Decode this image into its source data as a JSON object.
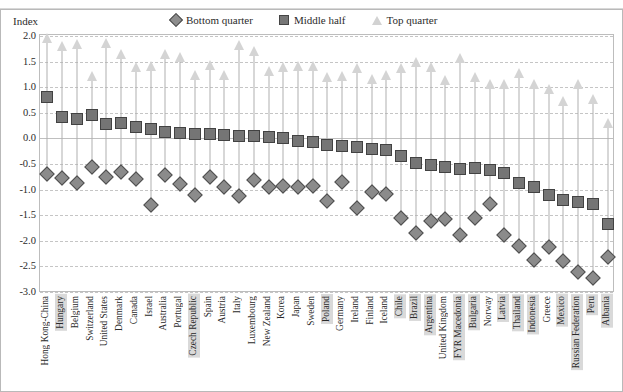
{
  "top_cut_text": " ",
  "axis": {
    "index_label": "Index",
    "y_ticks": [
      "2.0",
      "1.5",
      "1.0",
      "0.5",
      "0.0",
      "-0.5",
      "-1.0",
      "-1.5",
      "-2.0",
      "-2.5",
      "-3.0"
    ]
  },
  "legend": {
    "items": [
      {
        "label": "Bottom quarter",
        "icon": "diamond-marker",
        "color": "#8d8d8d"
      },
      {
        "label": "Middle half",
        "icon": "square-marker",
        "color": "#777777"
      },
      {
        "label": "Top quarter",
        "icon": "triangle-marker",
        "color": "#d2d2d2"
      }
    ]
  },
  "chart_data": {
    "type": "scatter",
    "title": "",
    "xlabel": "",
    "ylabel": "Index",
    "ylim": [
      -3.0,
      2.0
    ],
    "ytick_step": 0.5,
    "grid": true,
    "legend_position": "top",
    "categories": [
      "Hong Kong-China",
      "Hungary",
      "Belgium",
      "Switzerland",
      "United States",
      "Denmark",
      "Canada",
      "Israel",
      "Australia",
      "Portugal",
      "Czech Republic",
      "Spain",
      "Austria",
      "Italy",
      "Luxembourg",
      "New Zealand",
      "Korea",
      "Japan",
      "Sweden",
      "Poland",
      "Germany",
      "Ireland",
      "Finland",
      "Iceland",
      "Chile",
      "Brazil",
      "Argentina",
      "United Kingdom",
      "FYR Macedonia",
      "Bulgaria",
      "Norway",
      "Latvia",
      "Thailand",
      "Indonesia",
      "Greece",
      "Mexico",
      "Russian Federation",
      "Peru",
      "Albania"
    ],
    "highlighted_categories": [
      "Hungary",
      "Czech Republic",
      "Poland",
      "Chile",
      "Brazil",
      "Argentina",
      "FYR Macedonia",
      "Bulgaria",
      "Latvia",
      "Thailand",
      "Indonesia",
      "Mexico",
      "Russian Federation",
      "Peru",
      "Albania"
    ],
    "series": [
      {
        "name": "Bottom quarter",
        "marker": "diamond",
        "values": [
          -0.7,
          -0.78,
          -0.88,
          -0.55,
          -0.75,
          -0.65,
          -0.8,
          -1.3,
          -0.72,
          -0.9,
          -1.1,
          -0.75,
          -0.95,
          -1.12,
          -0.82,
          -0.95,
          -0.92,
          -0.95,
          -0.92,
          -1.22,
          -0.85,
          -1.35,
          -1.05,
          -1.08,
          -1.55,
          -1.85,
          -1.62,
          -1.58,
          -1.88,
          -1.55,
          -1.28,
          -1.88,
          -2.1,
          -2.38,
          -2.12,
          -2.4,
          -2.6,
          -2.72,
          -2.32
        ]
      },
      {
        "name": "Middle half",
        "marker": "square",
        "values": [
          0.8,
          0.42,
          0.38,
          0.45,
          0.28,
          0.3,
          0.22,
          0.18,
          0.12,
          0.1,
          0.08,
          0.08,
          0.06,
          0.05,
          0.05,
          0.02,
          0.0,
          -0.05,
          -0.08,
          -0.12,
          -0.15,
          -0.17,
          -0.2,
          -0.22,
          -0.35,
          -0.48,
          -0.52,
          -0.55,
          -0.6,
          -0.58,
          -0.62,
          -0.68,
          -0.88,
          -0.95,
          -1.1,
          -1.2,
          -1.25,
          -1.28,
          -1.68
        ]
      },
      {
        "name": "Top quarter",
        "marker": "triangle",
        "values": [
          1.95,
          1.78,
          1.82,
          1.2,
          1.85,
          1.62,
          1.38,
          1.4,
          1.62,
          1.58,
          1.22,
          1.42,
          1.22,
          1.8,
          1.68,
          1.3,
          1.38,
          1.4,
          1.4,
          1.18,
          1.2,
          1.35,
          1.15,
          1.22,
          1.35,
          1.48,
          1.38,
          1.12,
          1.55,
          1.18,
          1.05,
          1.05,
          1.25,
          1.05,
          0.95,
          0.72,
          1.05,
          0.75,
          0.28
        ]
      }
    ]
  }
}
